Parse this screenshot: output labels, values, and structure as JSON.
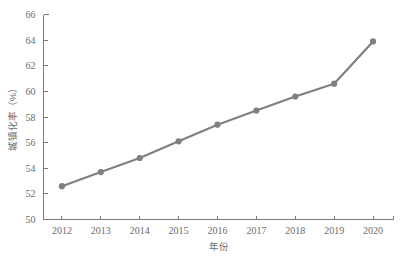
{
  "chart_data": {
    "type": "line",
    "title": "",
    "subtitle": "",
    "xlabel": "年份",
    "ylabel": "城镇化率（%）",
    "categories": [
      "2012",
      "2013",
      "2014",
      "2015",
      "2016",
      "2017",
      "2018",
      "2019",
      "2020"
    ],
    "x": [
      2012,
      2013,
      2014,
      2015,
      2016,
      2017,
      2018,
      2019,
      2020
    ],
    "values": [
      52.6,
      53.7,
      54.8,
      56.1,
      57.4,
      58.5,
      59.6,
      60.6,
      63.9
    ],
    "series": [
      {
        "name": "城镇化率（%）",
        "values": [
          52.6,
          53.7,
          54.8,
          56.1,
          57.4,
          58.5,
          59.6,
          60.6,
          63.9
        ]
      }
    ],
    "ylim": [
      50,
      66
    ],
    "xlim": [
      2011.6,
      2020.4
    ],
    "ytick_labels": [
      "50",
      "52",
      "54",
      "56",
      "58",
      "60",
      "62",
      "64",
      "66"
    ],
    "yticks": [
      50,
      52,
      54,
      56,
      58,
      60,
      62,
      64,
      66
    ],
    "xtick_labels": [
      "2012",
      "2013",
      "2014",
      "2015",
      "2016",
      "2017",
      "2018",
      "2019",
      "2020"
    ],
    "grid": false,
    "legend": "none",
    "marker": "circle",
    "line_color": "#808080",
    "marker_color": "#808080",
    "axis_color": "#7a7a7a",
    "text_color": "#6b6b6b",
    "background": "#ffffff"
  }
}
